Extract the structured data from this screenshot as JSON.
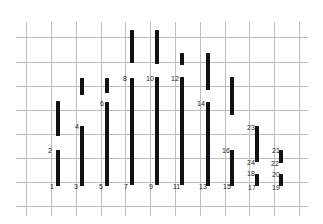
{
  "diagram": {
    "type": "segment-grid",
    "grid": {
      "color": "#bdbdbd",
      "vertical_x": [
        26,
        51,
        76,
        101,
        125,
        150,
        175,
        200,
        225,
        249,
        274,
        299
      ],
      "horizontal_y": [
        37,
        62,
        86,
        110,
        134,
        158,
        182,
        206
      ],
      "x_extent": [
        16,
        308
      ],
      "y_extent": [
        22,
        216
      ]
    },
    "segment_color": "#111111",
    "segments": [
      {
        "x": 56,
        "y1": 101,
        "y2": 136,
        "top_label": "",
        "bottom_label": ""
      },
      {
        "x": 56,
        "y1": 150,
        "y2": 186,
        "top_label": "2",
        "bottom_label": "1"
      },
      {
        "x": 80,
        "y1": 78,
        "y2": 95,
        "top_label": "",
        "bottom_label": ""
      },
      {
        "x": 80,
        "y1": 126,
        "y2": 186,
        "top_label": "4",
        "bottom_label": "3"
      },
      {
        "x": 105,
        "y1": 78,
        "y2": 93,
        "top_label": "",
        "bottom_label": ""
      },
      {
        "x": 105,
        "y1": 102,
        "y2": 186,
        "top_label": "6",
        "bottom_label": "5"
      },
      {
        "x": 130,
        "y1": 30,
        "y2": 63,
        "top_label": "",
        "bottom_label": ""
      },
      {
        "x": 130,
        "y1": 78,
        "y2": 185,
        "top_label": "8",
        "bottom_label": "7"
      },
      {
        "x": 155,
        "y1": 30,
        "y2": 64,
        "top_label": "",
        "bottom_label": ""
      },
      {
        "x": 155,
        "y1": 77,
        "y2": 185,
        "top_label": "10",
        "bottom_label": "9"
      },
      {
        "x": 180,
        "y1": 53,
        "y2": 65,
        "top_label": "",
        "bottom_label": ""
      },
      {
        "x": 180,
        "y1": 77,
        "y2": 185,
        "top_label": "12",
        "bottom_label": "11"
      },
      {
        "x": 206,
        "y1": 53,
        "y2": 90,
        "top_label": "",
        "bottom_label": ""
      },
      {
        "x": 206,
        "y1": 102,
        "y2": 186,
        "top_label": "14",
        "bottom_label": "13"
      },
      {
        "x": 230,
        "y1": 77,
        "y2": 115,
        "top_label": "",
        "bottom_label": ""
      },
      {
        "x": 230,
        "y1": 150,
        "y2": 186,
        "top_label": "16",
        "bottom_label": "15"
      },
      {
        "x": 255,
        "y1": 126,
        "y2": 162,
        "top_label": "23",
        "bottom_label": "24"
      },
      {
        "x": 255,
        "y1": 174,
        "y2": 186,
        "top_label": "18",
        "bottom_label": "17"
      },
      {
        "x": 279,
        "y1": 150,
        "y2": 163,
        "top_label": "21",
        "bottom_label": "22"
      },
      {
        "x": 279,
        "y1": 174,
        "y2": 186,
        "top_label": "20",
        "bottom_label": "19"
      }
    ],
    "labels": [
      {
        "text": "1",
        "x": 50,
        "y": 183
      },
      {
        "text": "2",
        "x": 48,
        "y": 147
      },
      {
        "text": "3",
        "x": 74,
        "y": 183
      },
      {
        "text": "4",
        "x": 75,
        "y": 123
      },
      {
        "text": "5",
        "x": 99,
        "y": 183
      },
      {
        "text": "6",
        "x": 100,
        "y": 100
      },
      {
        "text": "7",
        "x": 124,
        "y": 183
      },
      {
        "text": "8",
        "x": 123,
        "y": 75
      },
      {
        "text": "9",
        "x": 149,
        "y": 183
      },
      {
        "text": "10",
        "x": 146,
        "y": 75
      },
      {
        "text": "11",
        "x": 173,
        "y": 183
      },
      {
        "text": "12",
        "x": 171,
        "y": 75
      },
      {
        "text": "13",
        "x": 199,
        "y": 183
      },
      {
        "text": "14",
        "x": 197,
        "y": 100
      },
      {
        "text": "15",
        "x": 223,
        "y": 183
      },
      {
        "text": "16",
        "x": 222,
        "y": 147
      },
      {
        "text": "17",
        "x": 248,
        "y": 184
      },
      {
        "text": "18",
        "x": 247,
        "y": 170
      },
      {
        "text": "24",
        "x": 247,
        "y": 159
      },
      {
        "text": "23",
        "x": 247,
        "y": 124
      },
      {
        "text": "19",
        "x": 272,
        "y": 184
      },
      {
        "text": "20",
        "x": 272,
        "y": 171
      },
      {
        "text": "22",
        "x": 271,
        "y": 160
      },
      {
        "text": "21",
        "x": 272,
        "y": 147
      }
    ]
  }
}
